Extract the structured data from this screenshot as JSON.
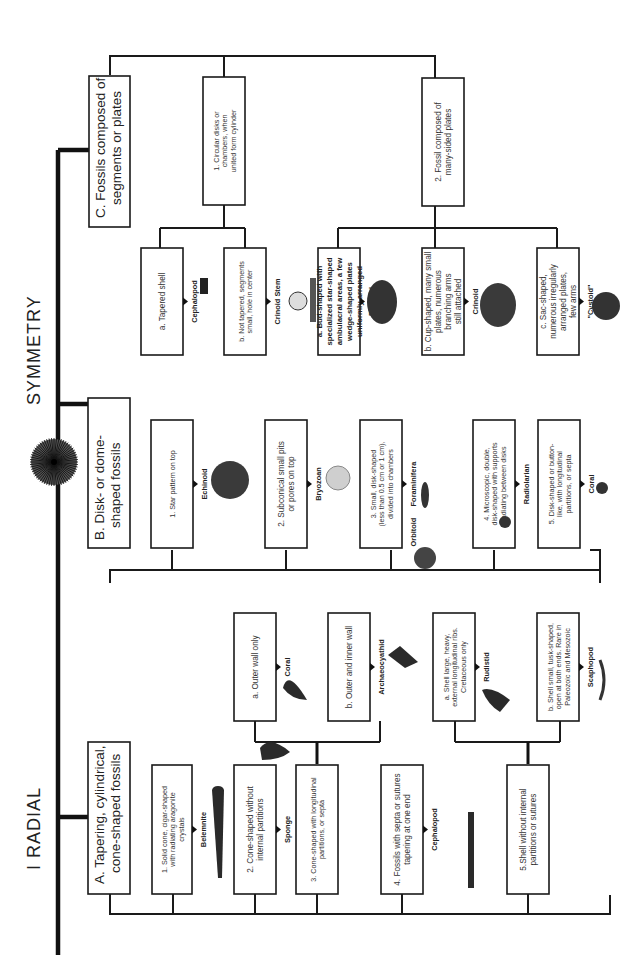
{
  "title": {
    "part1": "I  RADIAL",
    "part2": "SYMMETRY"
  },
  "groups": {
    "A": {
      "lines": [
        "A. Tapering, cylindrical,",
        "cone-shaped fossils"
      ]
    },
    "B": {
      "lines": [
        "B. Disk- or dome-",
        "shaped fossils"
      ]
    },
    "C": {
      "lines": [
        "C. Fossils composed of",
        "segments or plates"
      ]
    }
  },
  "A_items": [
    {
      "lines": [
        "1. Solid cone, cigar-shaped",
        "with radiating aragonite",
        "crystals"
      ],
      "label": "Belemnite"
    },
    {
      "lines": [
        "2.  Cone-shaped without",
        "internal partitions"
      ],
      "label": "Sponge"
    },
    {
      "lines": [
        "3. Cone-shaped with longitudinal",
        "partitions, or septa"
      ],
      "label": ""
    },
    {
      "lines": [
        "4.  Fossils with septa or sutures",
        "tapering at one end"
      ],
      "label": "Cephalopod"
    },
    {
      "lines": [
        "5.Shell without internal",
        "partitions or sutures"
      ],
      "label": ""
    }
  ],
  "A3_sub": [
    {
      "lines": [
        "a.  Outer  wall  only"
      ],
      "label": "Coral"
    },
    {
      "lines": [
        "b.  Outer  and  inner  wall"
      ],
      "label": "Archaeocyathid"
    }
  ],
  "A5_sub": [
    {
      "lines": [
        "a. Shell large, heavy,",
        "external longitudinal ribs.",
        "Cretaceous only"
      ],
      "label": "Rudistid"
    },
    {
      "lines": [
        "b. Shell small, tusk-shaped,",
        "open at both ends. Rare in",
        "Paleozoic and Mesozoic"
      ],
      "label": "Scaphopod"
    }
  ],
  "B_items": [
    {
      "lines": [
        "1. Star pattern on top"
      ],
      "label": "Echinoid"
    },
    {
      "lines": [
        "2.  Subconical small pits",
        "or pores on top"
      ],
      "label": "Bryozoan"
    },
    {
      "lines": [
        "3. Small, disk-shaped",
        "(less than 0.5 cm or 1 cm),",
        "divided into chambers"
      ],
      "label": "Foraminifera",
      "label2": "Orbitoid"
    },
    {
      "lines": [
        "4. Microscopic, double,",
        "disk-shaped with supports",
        "radiating between disks"
      ],
      "label": "Radiolarian"
    },
    {
      "lines": [
        "5. Disk-shaped or button-",
        "like, with longitudinal",
        "partitions, or septa"
      ],
      "label": "Coral"
    }
  ],
  "C_items": [
    {
      "lines": [
        "1. Circular disks or",
        "chambers, when",
        "united form cylinder"
      ]
    },
    {
      "lines": [
        "2.  Fossil composed of",
        "many-sided plates"
      ]
    }
  ],
  "C1_sub": [
    {
      "lines": [
        "a.  Tapered  shell"
      ],
      "label": "Cephalopod"
    },
    {
      "lines": [
        "b.  Not tapered, segments",
        "small, hole in center"
      ],
      "label": "Crinoid  Stem"
    }
  ],
  "C2_sub": [
    {
      "lines": [
        "a.  Bud-shaped  with",
        "specialized  star-shaped",
        "ambulacral  areas,  a  few",
        "wedge-shaped  plates",
        "uniformly  arranged"
      ],
      "label": "Blastoid"
    },
    {
      "lines": [
        "b.  Cup-shaped, many small",
        "plates,  numerous",
        "branching  arms",
        "still  attached"
      ],
      "label": "Crinoid"
    },
    {
      "lines": [
        "c.  Sac-shaped,",
        "numerous  irregularly",
        "arranged  plates,",
        "few  arms"
      ],
      "label": "\"Cystoid\""
    }
  ]
}
